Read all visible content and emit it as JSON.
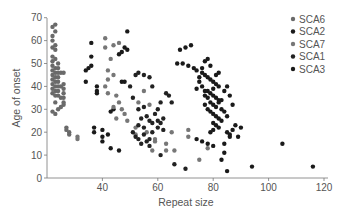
{
  "chart_data": {
    "type": "scatter",
    "title": "",
    "xlabel": "Repeat size",
    "ylabel": "Age of onset",
    "xlim": [
      20,
      122
    ],
    "ylim": [
      0,
      70
    ],
    "xticks": [
      40,
      60,
      80,
      100,
      120
    ],
    "yticks": [
      0,
      10,
      20,
      30,
      40,
      50,
      60,
      70
    ],
    "grid": false,
    "legend_position": "upper right",
    "legend": [
      "SCA6",
      "SCA2",
      "SCA7",
      "SCA1",
      "SCA3"
    ],
    "series": [
      {
        "name": "SCA6",
        "color": "#6a6a6a",
        "points": [
          [
            22,
            66
          ],
          [
            23,
            67
          ],
          [
            22,
            62
          ],
          [
            23,
            64
          ],
          [
            22,
            60
          ],
          [
            23,
            58
          ],
          [
            22,
            57
          ],
          [
            23,
            56
          ],
          [
            22,
            53
          ],
          [
            23,
            52
          ],
          [
            22,
            51
          ],
          [
            24,
            50
          ],
          [
            22,
            49
          ],
          [
            23,
            48
          ],
          [
            24,
            48
          ],
          [
            22,
            47
          ],
          [
            23,
            46
          ],
          [
            24,
            46
          ],
          [
            25,
            46
          ],
          [
            22,
            45
          ],
          [
            23,
            44
          ],
          [
            24,
            44
          ],
          [
            22,
            43
          ],
          [
            23,
            42
          ],
          [
            24,
            42
          ],
          [
            22,
            41
          ],
          [
            23,
            40
          ],
          [
            24,
            40
          ],
          [
            25,
            40
          ],
          [
            22,
            39
          ],
          [
            23,
            38
          ],
          [
            24,
            38
          ],
          [
            22,
            37
          ],
          [
            23,
            36
          ],
          [
            24,
            36
          ],
          [
            25,
            35
          ],
          [
            23,
            33
          ],
          [
            24,
            30
          ],
          [
            22,
            29
          ],
          [
            23,
            28
          ],
          [
            26,
            41
          ],
          [
            26,
            39
          ],
          [
            26,
            37
          ],
          [
            26,
            35
          ],
          [
            26,
            33
          ],
          [
            26,
            32
          ],
          [
            25,
            31
          ],
          [
            26,
            46
          ],
          [
            27,
            22
          ],
          [
            27,
            21
          ],
          [
            28,
            20
          ],
          [
            28,
            19
          ]
        ]
      },
      {
        "name": "SCA2",
        "color": "#1a1a1a",
        "points": [
          [
            36,
            59
          ],
          [
            36,
            53
          ],
          [
            35,
            48
          ],
          [
            34,
            47
          ],
          [
            36,
            49
          ],
          [
            34,
            42
          ],
          [
            38,
            40
          ],
          [
            38,
            38
          ],
          [
            38,
            37
          ],
          [
            37,
            22
          ],
          [
            37,
            20
          ],
          [
            40,
            21
          ],
          [
            40,
            18
          ],
          [
            42,
            19
          ],
          [
            40,
            16
          ],
          [
            43,
            13
          ],
          [
            46,
            12
          ],
          [
            43,
            29
          ],
          [
            44,
            30
          ],
          [
            47,
            42
          ],
          [
            48,
            42
          ],
          [
            46,
            54
          ],
          [
            48,
            57
          ],
          [
            47,
            55
          ],
          [
            49,
            56
          ],
          [
            49,
            64
          ]
        ]
      },
      {
        "name": "SCA7",
        "color": "#777777",
        "points": [
          [
            31,
            18
          ],
          [
            31,
            17
          ],
          [
            41,
            61
          ],
          [
            41,
            57
          ],
          [
            44,
            58
          ],
          [
            46,
            59
          ],
          [
            43,
            52
          ],
          [
            42,
            47
          ],
          [
            44,
            45
          ],
          [
            42,
            43
          ],
          [
            41,
            40
          ],
          [
            42,
            37
          ],
          [
            45,
            36
          ],
          [
            46,
            33
          ],
          [
            44,
            31
          ],
          [
            47,
            30
          ],
          [
            48,
            28
          ],
          [
            45,
            26
          ],
          [
            49,
            25
          ],
          [
            52,
            22
          ],
          [
            52,
            19
          ],
          [
            56,
            20
          ],
          [
            59,
            17
          ],
          [
            59,
            16
          ],
          [
            58,
            12
          ],
          [
            53,
            33
          ],
          [
            55,
            38
          ],
          [
            57,
            32
          ],
          [
            63,
            15
          ],
          [
            63,
            12
          ],
          [
            66,
            12
          ],
          [
            65,
            20
          ],
          [
            71,
            21
          ],
          [
            71,
            18
          ],
          [
            75,
            8
          ],
          [
            78,
            13
          ]
        ]
      },
      {
        "name": "SCA1",
        "color": "#222222",
        "points": [
          [
            50,
            40
          ],
          [
            52,
            45
          ],
          [
            53,
            46
          ],
          [
            55,
            45
          ],
          [
            57,
            44
          ],
          [
            58,
            40
          ],
          [
            51,
            35
          ],
          [
            53,
            30
          ],
          [
            55,
            31
          ],
          [
            56,
            27
          ],
          [
            57,
            25
          ],
          [
            58,
            24
          ],
          [
            60,
            25
          ],
          [
            61,
            24
          ],
          [
            60,
            22
          ],
          [
            62,
            21
          ],
          [
            51,
            20
          ],
          [
            52,
            18
          ],
          [
            53,
            17
          ],
          [
            54,
            15
          ],
          [
            56,
            16
          ],
          [
            57,
            14
          ],
          [
            55,
            19
          ],
          [
            58,
            20
          ],
          [
            60,
            30
          ],
          [
            61,
            33
          ],
          [
            63,
            37
          ],
          [
            64,
            36
          ],
          [
            65,
            33
          ],
          [
            53,
            23
          ],
          [
            55,
            22
          ],
          [
            54,
            26
          ],
          [
            59,
            28
          ],
          [
            62,
            26
          ],
          [
            57,
            17
          ],
          [
            61,
            10
          ],
          [
            66,
            6
          ],
          [
            70,
            4
          ]
        ]
      },
      {
        "name": "SCA3",
        "color": "#1a1a1a",
        "points": [
          [
            68,
            56
          ],
          [
            70,
            57
          ],
          [
            72,
            58
          ],
          [
            67,
            50
          ],
          [
            69,
            50
          ],
          [
            71,
            49
          ],
          [
            73,
            48
          ],
          [
            74,
            47
          ],
          [
            76,
            46
          ],
          [
            77,
            45
          ],
          [
            75,
            44
          ],
          [
            78,
            44
          ],
          [
            79,
            43
          ],
          [
            80,
            42
          ],
          [
            81,
            41
          ],
          [
            82,
            40
          ],
          [
            76,
            40
          ],
          [
            77,
            38
          ],
          [
            78,
            38
          ],
          [
            79,
            37
          ],
          [
            80,
            36
          ],
          [
            81,
            35
          ],
          [
            82,
            34
          ],
          [
            78,
            35
          ],
          [
            79,
            33
          ],
          [
            80,
            32
          ],
          [
            81,
            31
          ],
          [
            83,
            30
          ],
          [
            84,
            29
          ],
          [
            77,
            32
          ],
          [
            78,
            30
          ],
          [
            79,
            29
          ],
          [
            80,
            28
          ],
          [
            81,
            27
          ],
          [
            82,
            26
          ],
          [
            83,
            25
          ],
          [
            80,
            24
          ],
          [
            81,
            23
          ],
          [
            82,
            22
          ],
          [
            79,
            20
          ],
          [
            80,
            21
          ],
          [
            85,
            20
          ],
          [
            86,
            18
          ],
          [
            74,
            17
          ],
          [
            76,
            16
          ],
          [
            78,
            15
          ],
          [
            80,
            14
          ],
          [
            84,
            11
          ],
          [
            86,
            19
          ],
          [
            85,
            27
          ],
          [
            87,
            21
          ],
          [
            89,
            18
          ],
          [
            84,
            15
          ],
          [
            83,
            8
          ],
          [
            85,
            3
          ],
          [
            82,
            33
          ],
          [
            83,
            34
          ],
          [
            80,
            39
          ],
          [
            81,
            45
          ],
          [
            82,
            46
          ],
          [
            77,
            51
          ],
          [
            78,
            52
          ],
          [
            79,
            49
          ],
          [
            76,
            48
          ],
          [
            75,
            42
          ],
          [
            74,
            39
          ],
          [
            77,
            36
          ],
          [
            84,
            38
          ],
          [
            85,
            40
          ],
          [
            86,
            36
          ],
          [
            87,
            32
          ],
          [
            88,
            23
          ],
          [
            90,
            22
          ],
          [
            94,
            5
          ],
          [
            105,
            15
          ],
          [
            116,
            5
          ]
        ]
      }
    ]
  }
}
